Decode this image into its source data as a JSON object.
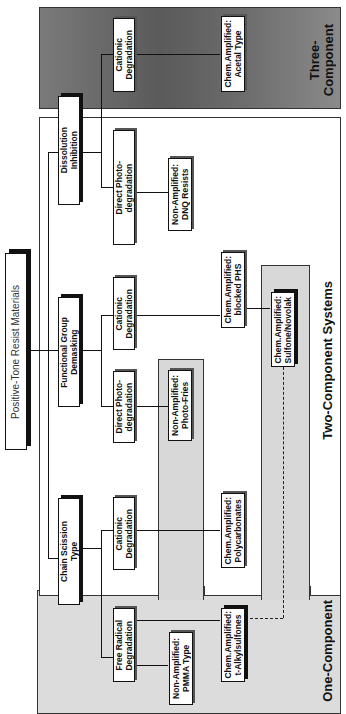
{
  "diagram": {
    "title": "Positive-Tone Resist Materials",
    "orientation": "rotated-90-ccw",
    "regions": {
      "three_component": "Three-\nComponent",
      "two_component": "Two-Component  Systems",
      "one_component": "One-Component"
    },
    "mechanisms": {
      "dissolution_inhibition": "Dissolution\nInhibition",
      "functional_group_demasking": "Functional  Group\nDemasking",
      "chain_scission": "Chain  Scission\nType"
    },
    "sub_mechanisms": {
      "di_cationic": "Cationic\nDegradation",
      "di_direct_photo": "Direct  Photo-\ndegradation",
      "fgd_cationic": "Cationic\nDegradation",
      "fgd_direct_photo": "Direct  Photo-\ndegradation",
      "cs_cationic": "Cationic\nDegradation",
      "cs_free_radical": "Free  Radical\nDegradation"
    },
    "resists": {
      "acetal": "Chem.Amplified:\nAcetal  Type",
      "dnq": "Non-Amplified:\nDNQ  Resists",
      "blocked_phs": "Chem.Amplified:\nblocked  PHS",
      "sulfone_novolak": "Chem.Amplified:\nSulfone/Novolak",
      "photo_fries": "Non-Amplified:\nPhoto-Fries",
      "polycarbonates": "Chem.Amplified:\nPolycarbonates",
      "t_alkylsulfones": "Chem.Amplified:\nt-Alkylsulfones",
      "pmma": "Non-Amplified:\nPMMA  Type"
    },
    "colors": {
      "three_component_bg": "#6a6a6a",
      "one_component_bg": "#dcdcdc",
      "strip_bg": "#d8d8d8",
      "box_border": "#111111"
    }
  }
}
